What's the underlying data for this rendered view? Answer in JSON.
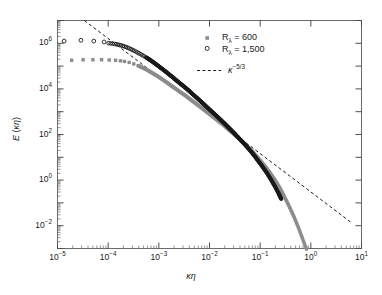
{
  "chart_data": {
    "type": "scatter",
    "title": "",
    "xlabel": "κη",
    "ylabel": "E (κη)",
    "xscale": "log",
    "yscale": "log",
    "xlim": [
      1e-05,
      10
    ],
    "ylim": [
      0.001,
      10000000.0
    ],
    "xticks": [
      "10−5",
      "10−4",
      "10−3",
      "10−2",
      "10−1",
      "10⁰",
      "10¹"
    ],
    "xtick_values": [
      1e-05,
      0.0001,
      0.001,
      0.01,
      0.1,
      1,
      10
    ],
    "yticks": [
      "10−2",
      "10⁰",
      "10²",
      "10⁴",
      "10⁶"
    ],
    "ytick_values": [
      0.01,
      1,
      100,
      10000,
      1000000
    ],
    "grid": false,
    "legend_position": "top-right",
    "series": [
      {
        "name": "Rλ = 600",
        "marker": "filled-square",
        "color": "#8c8c8c",
        "points": [
          [
            1.9e-05,
            180000.0
          ],
          [
            3.2e-05,
            190000.0
          ],
          [
            5e-05,
            190000.0
          ],
          [
            7.4e-05,
            190000.0
          ],
          [
            0.000105,
            185000.0
          ],
          [
            0.00014,
            180000.0
          ],
          [
            0.000175,
            170000.0
          ],
          [
            0.00021,
            160000.0
          ],
          [
            0.00026,
            145000.0
          ],
          [
            0.00032,
            125000.0
          ],
          [
            0.00039,
            105000.0
          ],
          [
            0.00048,
            85000.0
          ],
          [
            0.0006,
            66000.0
          ],
          [
            0.00074,
            50000.0
          ],
          [
            0.00091,
            38000.0
          ],
          [
            0.00112,
            28000.0
          ],
          [
            0.0014,
            20000.0
          ],
          [
            0.0017,
            14500.0
          ],
          [
            0.0021,
            10500.0
          ],
          [
            0.0026,
            7400.0
          ],
          [
            0.0033,
            5200.0
          ],
          [
            0.0041,
            3600.0
          ],
          [
            0.0051,
            2500.0
          ],
          [
            0.0063,
            1750.0
          ],
          [
            0.0078,
            1200.0
          ],
          [
            0.0097,
            830.0
          ],
          [
            0.012,
            570.0
          ],
          [
            0.015,
            390.0
          ],
          [
            0.019,
            260.0
          ],
          [
            0.023,
            175.0
          ],
          [
            0.029,
            115.0
          ],
          [
            0.036,
            76.0
          ],
          [
            0.044,
            49.0
          ],
          [
            0.055,
            31.0
          ],
          [
            0.068,
            19.0
          ],
          [
            0.084,
            11.5
          ],
          [
            0.104,
            6.6
          ],
          [
            0.129,
            3.7
          ],
          [
            0.16,
            1.95
          ],
          [
            0.198,
            0.97
          ],
          [
            0.245,
            0.45
          ],
          [
            0.3,
            0.19
          ],
          [
            0.37,
            0.074
          ],
          [
            0.46,
            0.026
          ],
          [
            0.57,
            0.0082
          ],
          [
            0.7,
            0.0024
          ],
          [
            0.87,
            0.00065
          ],
          [
            1.05,
            0.0002
          ],
          [
            1.25,
            9e-05
          ],
          [
            1.35,
            6e-05
          ]
        ]
      },
      {
        "name": "Rλ = 1,500",
        "marker": "open-circle",
        "color": "#1a1a1a",
        "points": [
          [
            1.35e-05,
            1250000.0
          ],
          [
            2.9e-05,
            1350000.0
          ],
          [
            5.2e-05,
            1250000.0
          ],
          [
            8.3e-05,
            1150000.0
          ],
          [
            0.000105,
            1000000.0
          ],
          [
            0.00013,
            950000.0
          ],
          [
            0.000155,
            880000.0
          ],
          [
            0.000185,
            800000.0
          ],
          [
            0.00022,
            700000.0
          ],
          [
            0.00026,
            600000.0
          ],
          [
            0.00031,
            500000.0
          ],
          [
            0.00037,
            410000.0
          ],
          [
            0.00044,
            330000.0
          ],
          [
            0.00053,
            260000.0
          ],
          [
            0.00064,
            200000.0
          ],
          [
            0.00077,
            150000.0
          ],
          [
            0.00092,
            112000.0
          ],
          [
            0.0011,
            83000.0
          ],
          [
            0.00133,
            60000.0
          ],
          [
            0.0016,
            43000.0
          ],
          [
            0.00193,
            31000.0
          ],
          [
            0.0023,
            22000.0
          ],
          [
            0.0028,
            15500.0
          ],
          [
            0.0034,
            11000.0
          ],
          [
            0.0041,
            7600.0
          ],
          [
            0.0049,
            5300.0
          ],
          [
            0.0059,
            3700.0
          ],
          [
            0.0071,
            2550.0
          ],
          [
            0.0085,
            1750.0
          ],
          [
            0.0102,
            1200.0
          ],
          [
            0.0123,
            820.0
          ],
          [
            0.0148,
            560.0
          ],
          [
            0.0178,
            380.0
          ],
          [
            0.0214,
            255.0
          ],
          [
            0.0257,
            170.0
          ],
          [
            0.031,
            112.0
          ],
          [
            0.037,
            73.0
          ],
          [
            0.045,
            47.0
          ],
          [
            0.054,
            30.0
          ],
          [
            0.065,
            18.7
          ],
          [
            0.078,
            11.3
          ],
          [
            0.093,
            6.6
          ],
          [
            0.112,
            3.8
          ],
          [
            0.135,
            2.1
          ],
          [
            0.162,
            1.1
          ],
          [
            0.195,
            0.54
          ],
          [
            0.234,
            0.25
          ],
          [
            0.26,
            0.15
          ]
        ]
      }
    ],
    "reference_line": {
      "label": "κ−5/3",
      "style": "dashed",
      "color": "#1a1a1a",
      "slope": -1.6667,
      "x_start": 3.2e-05,
      "y_start": 11000000.0,
      "x_end": 6.5,
      "y_end": 0.013
    }
  },
  "legend": {
    "items": [
      {
        "label_prefix": "R",
        "label_sub": "λ",
        "label_rest": " = 600",
        "marker": "filled-square"
      },
      {
        "label_prefix": "R",
        "label_sub": "λ",
        "label_rest": " = 1,500",
        "marker": "open-circle"
      },
      {
        "label_prefix": "κ",
        "label_sub": "",
        "label_rest": "−5/3",
        "marker": "dashed-line"
      }
    ]
  },
  "axes": {
    "x_label": "κη",
    "y_label": "E (κη)",
    "x_tick_labels": [
      "10",
      "10",
      "10",
      "10",
      "10",
      "10",
      "10"
    ],
    "x_tick_exponents": [
      "−5",
      "−4",
      "−3",
      "−2",
      "−1",
      "0",
      "1"
    ],
    "y_tick_labels": [
      "10",
      "10",
      "10",
      "10",
      "10"
    ],
    "y_tick_exponents": [
      "−2",
      "0",
      "2",
      "4",
      "6"
    ]
  },
  "colors": {
    "series_600": "#8c8c8c",
    "series_1500": "#1a1a1a",
    "axis": "#4d4d4d",
    "text": "#1a1a1a",
    "background": "#ffffff"
  }
}
